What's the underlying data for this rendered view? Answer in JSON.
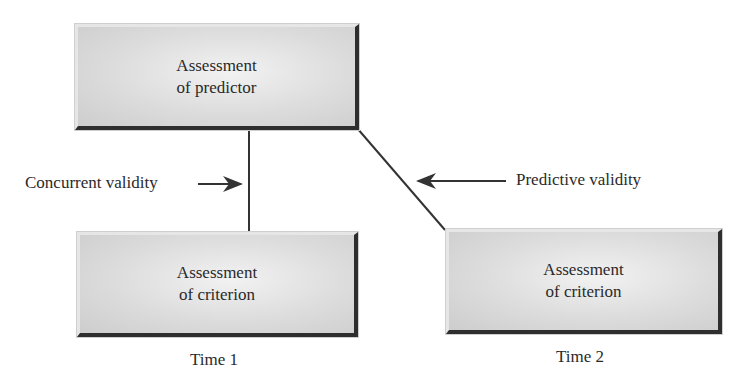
{
  "boxes": {
    "predictor": {
      "line1": "Assessment",
      "line2": "of predictor"
    },
    "criterion_time1": {
      "line1": "Assessment",
      "line2": "of criterion"
    },
    "criterion_time2": {
      "line1": "Assessment",
      "line2": "of criterion"
    }
  },
  "labels": {
    "concurrent": "Concurrent validity",
    "predictive": "Predictive validity",
    "time1": "Time 1",
    "time2": "Time 2"
  },
  "colors": {
    "line": "#333333",
    "box_fill": "#dcdcdc",
    "box_shadow": "#2e2e2e"
  }
}
